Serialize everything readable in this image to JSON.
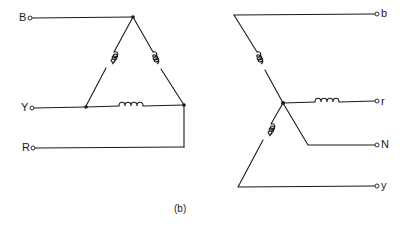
{
  "figure": {
    "caption": "(b)",
    "delta_side": {
      "terminals": [
        {
          "id": "B",
          "label": "B"
        },
        {
          "id": "Y",
          "label": "Y"
        },
        {
          "id": "R",
          "label": "R"
        }
      ],
      "windings": [
        "left-leg-coil",
        "right-leg-coil",
        "bottom-coil"
      ]
    },
    "star_side": {
      "terminals": [
        {
          "id": "b",
          "label": "b"
        },
        {
          "id": "r",
          "label": "r"
        },
        {
          "id": "N",
          "label": "N"
        },
        {
          "id": "y",
          "label": "y"
        }
      ],
      "windings": [
        "upper-arm-coil",
        "right-arm-coil",
        "lower-arm-coil"
      ]
    },
    "colors": {
      "line": "#1a1a1a",
      "background": "#ffffff"
    }
  }
}
